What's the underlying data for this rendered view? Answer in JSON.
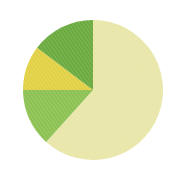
{
  "chart_data": {
    "type": "pie",
    "title": "",
    "subtitle": "",
    "xlabel": "",
    "ylabel": "",
    "legend_position": "none",
    "grid": false,
    "labels": [
      "Slice 1",
      "Slice 2",
      "Slice 3",
      "Slice 4"
    ],
    "values": [
      61.7,
      13.3,
      10.3,
      14.7
    ],
    "units": "percent",
    "start_angle_deg": 0,
    "direction": "clockwise",
    "colors": [
      "#e8e6a8",
      "#8cc152",
      "#e2d044",
      "#6aaa3e"
    ],
    "slices": [
      {
        "name": "Slice 1",
        "value": 61.7,
        "color": "#e8e6a8",
        "start_angle_deg": 0,
        "end_angle_deg": 222,
        "label": ""
      },
      {
        "name": "Slice 2",
        "value": 13.3,
        "color": "#8cc152",
        "start_angle_deg": 222,
        "end_angle_deg": 270,
        "label": ""
      },
      {
        "name": "Slice 3",
        "value": 10.3,
        "color": "#e2d044",
        "start_angle_deg": 270,
        "end_angle_deg": 307,
        "label": ""
      },
      {
        "name": "Slice 4",
        "value": 14.7,
        "color": "#6aaa3e",
        "start_angle_deg": 307,
        "end_angle_deg": 360,
        "label": ""
      }
    ],
    "geometry": {
      "center_x": 93,
      "center_y": 90,
      "radius": 70
    },
    "background_color": "#ffffff",
    "texture": "fine-diagonal-hatch"
  }
}
